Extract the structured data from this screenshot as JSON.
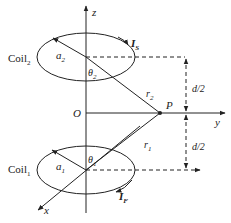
{
  "diagram": {
    "axes": {
      "z": "z",
      "y": "y",
      "x": "x",
      "origin": "O"
    },
    "coil_top": {
      "label": "Coil",
      "label_sub": "2",
      "radius_label": "a",
      "radius_sub": "2",
      "angle_label": "θ",
      "angle_sub": "2",
      "current_label": "I",
      "current_sub": "S",
      "distance_label": "r",
      "distance_sub": "2"
    },
    "coil_bottom": {
      "label": "Coil",
      "label_sub": "1",
      "radius_label": "a",
      "radius_sub": "1",
      "angle_label": "θ",
      "angle_sub": "1",
      "current_label": "I",
      "current_sub": "F",
      "distance_label": "r",
      "distance_sub": "1"
    },
    "point": "P",
    "half_spacing_top": "d/2",
    "half_spacing_bottom": "d/2",
    "colors": {
      "line": "#222222",
      "background": "#ffffff"
    }
  }
}
